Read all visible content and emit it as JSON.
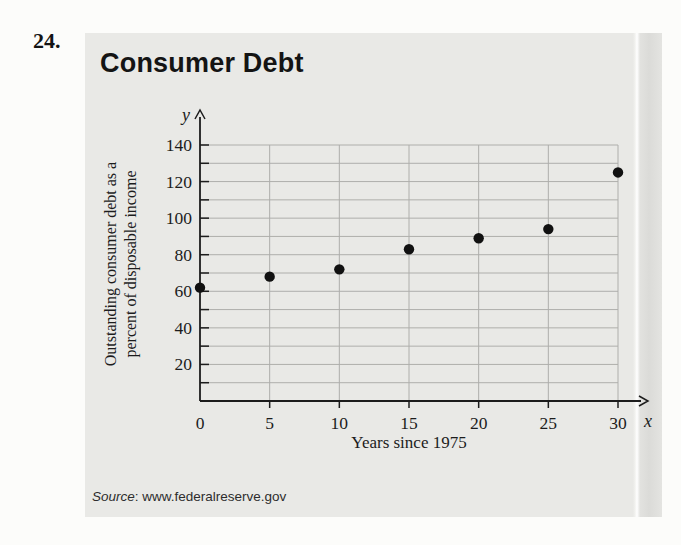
{
  "problem_number": "24.",
  "panel": {
    "title": "Consumer Debt",
    "source_label": "Source",
    "source_rest": ": www.federalreserve.gov"
  },
  "chart_data": {
    "type": "scatter",
    "title": "Consumer Debt",
    "x": [
      0,
      5,
      10,
      15,
      20,
      25,
      30
    ],
    "values": [
      62,
      68,
      72,
      83,
      89,
      94,
      125
    ],
    "xlabel": "Years since 1975",
    "ylabel": "Outstanding consumer debt as a percent of disposable income",
    "ylabel_lines": [
      "Outstanding consumer debt as a",
      "percent of disposable income"
    ],
    "x_axis_symbol": "x",
    "y_axis_symbol": "y",
    "xlim": [
      0,
      30
    ],
    "ylim": [
      0,
      140
    ],
    "x_tick_step": 5,
    "y_grid_step": 10,
    "y_label_step": 20,
    "grid": true,
    "legend": "none",
    "point_radius": 5.2,
    "colors": {
      "point": "#111111",
      "axis": "#1c1c1c",
      "grid": "#aeaeab",
      "panel_bg": "#e9e9e6",
      "text": "#1c1c1c"
    }
  }
}
